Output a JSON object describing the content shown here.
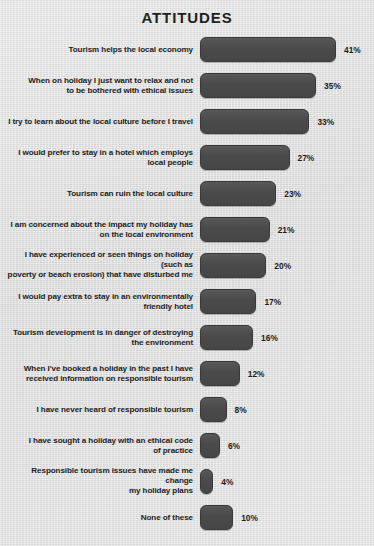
{
  "chart": {
    "title": "ATTITUDES"
  },
  "chart_data": {
    "type": "bar",
    "orientation": "horizontal",
    "title": "ATTITUDES",
    "subtitle": "",
    "xlabel": "",
    "ylabel": "",
    "xlim": [
      0,
      41
    ],
    "grid": false,
    "legend": null,
    "value_suffix": "%",
    "categories": [
      "Tourism helps the local economy",
      "When on holiday I just want to relax and not\nto be bothered with ethical issues",
      "I try to learn about the local culture before I travel",
      "I would prefer to stay in a hotel which employs\nlocal people",
      "Tourism can ruin the local culture",
      "I am concerned about the impact my holiday has\non the local environment",
      "I have experienced or seen things on holiday (such as\npoverty or beach erosion) that have disturbed me",
      "I would pay extra to stay in an environmentally\nfriendly hotel",
      "Tourism development is in danger of destroying\nthe environment",
      "When I've booked a holiday in the past I have\nreceived information on responsible tourism",
      "I have never heard of responsible tourism",
      "I have sought a holiday with an ethical code\nof practice",
      "Responsible tourism issues have made me change\nmy holiday plans",
      "None of these"
    ],
    "values": [
      41,
      35,
      33,
      27,
      23,
      21,
      20,
      17,
      16,
      12,
      8,
      6,
      4,
      10
    ],
    "value_labels": [
      "41%",
      "35%",
      "33%",
      "27%",
      "23%",
      "21%",
      "20%",
      "17%",
      "16%",
      "12%",
      "8%",
      "6%",
      "4%",
      "10%"
    ],
    "colors": {
      "bar_fill": "#4b4b4b",
      "bar_border": "#3a3a3a",
      "background": "#dedede",
      "text": "#1c1c1c"
    }
  }
}
